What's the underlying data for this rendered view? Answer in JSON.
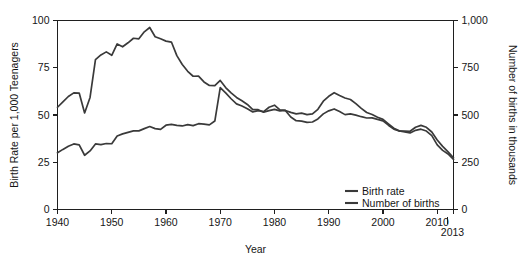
{
  "chart_data": {
    "type": "line",
    "title": "",
    "subtitle": "",
    "xlabel": "Year",
    "ylabel": "Birth Rate per 1,000 Teenagers",
    "y2label": "Number of births in thousands",
    "xlim": [
      1940,
      2013
    ],
    "ylim": [
      0,
      100
    ],
    "y2lim": [
      0,
      1000
    ],
    "xticks": [
      1940,
      1950,
      1960,
      1970,
      1980,
      1990,
      2000,
      2010
    ],
    "xticklabels": [
      "1940",
      "1950",
      "1960",
      "1970",
      "1980",
      "1990",
      "2000",
      "2010"
    ],
    "x_end_tick": 2013,
    "x_end_label": "2013",
    "yticks": [
      0,
      25,
      50,
      75,
      100
    ],
    "yticklabels": [
      "0",
      "25",
      "50",
      "75",
      "100"
    ],
    "y2ticks": [
      0,
      250,
      500,
      750,
      1000
    ],
    "y2ticklabels": [
      "0",
      "250",
      "500",
      "750",
      "1,000"
    ],
    "grid": false,
    "legend_position": "bottom-right",
    "line_color": "#3a3a3a",
    "axis_color": "#1f1f1f",
    "x": [
      1940,
      1941,
      1942,
      1943,
      1944,
      1945,
      1946,
      1947,
      1948,
      1949,
      1950,
      1951,
      1952,
      1953,
      1954,
      1955,
      1956,
      1957,
      1958,
      1959,
      1960,
      1961,
      1962,
      1963,
      1964,
      1965,
      1966,
      1967,
      1968,
      1969,
      1970,
      1971,
      1972,
      1973,
      1974,
      1975,
      1976,
      1977,
      1978,
      1979,
      1980,
      1981,
      1982,
      1983,
      1984,
      1985,
      1986,
      1987,
      1988,
      1989,
      1990,
      1991,
      1992,
      1993,
      1994,
      1995,
      1996,
      1997,
      1998,
      1999,
      2000,
      2001,
      2002,
      2003,
      2004,
      2005,
      2006,
      2007,
      2008,
      2009,
      2010,
      2011,
      2012,
      2013
    ],
    "series": [
      {
        "name": "Birth rate",
        "axis": "left",
        "unit": "births per 1,000 teenagers aged 15-19",
        "values": [
          54.1,
          56.9,
          59.8,
          61.7,
          61.6,
          51.1,
          59.3,
          79.3,
          81.8,
          83.4,
          81.6,
          87.6,
          86.1,
          88.2,
          90.6,
          90.3,
          94.0,
          96.3,
          91.4,
          90.3,
          89.1,
          88.6,
          81.4,
          76.7,
          73.1,
          70.5,
          70.6,
          67.5,
          65.6,
          65.5,
          68.3,
          64.5,
          61.7,
          59.3,
          57.5,
          55.6,
          52.8,
          52.8,
          51.5,
          52.3,
          53.0,
          52.2,
          52.4,
          51.4,
          50.6,
          51.0,
          50.2,
          50.6,
          53.0,
          57.3,
          59.9,
          61.8,
          60.3,
          59.0,
          58.2,
          56.0,
          53.5,
          51.3,
          50.3,
          48.8,
          47.7,
          45.3,
          43.0,
          41.6,
          41.1,
          40.5,
          41.9,
          42.5,
          41.5,
          39.1,
          34.2,
          31.3,
          29.4,
          26.5
        ]
      },
      {
        "name": "Number of births",
        "axis": "right",
        "unit": "thousands of births to teenagers",
        "values": [
          300,
          318,
          335,
          347,
          342,
          287,
          310,
          347,
          343,
          349,
          348,
          389,
          400,
          408,
          416,
          416,
          428,
          439,
          428,
          424,
          446,
          450,
          445,
          442,
          449,
          444,
          454,
          452,
          448,
          468,
          645,
          617,
          586,
          559,
          548,
          533,
          516,
          523,
          518,
          541,
          552,
          527,
          524,
          489,
          470,
          468,
          461,
          463,
          479,
          506,
          522,
          532,
          518,
          502,
          506,
          499,
          491,
          484,
          485,
          477,
          469,
          446,
          425,
          415,
          415,
          414,
          435,
          445,
          435,
          410,
          368,
          334,
          305,
          274
        ]
      }
    ]
  },
  "legend": {
    "items": [
      {
        "label": "Birth rate",
        "color": "#3a3a3a"
      },
      {
        "label": "Number of births",
        "color": "#3a3a3a"
      }
    ]
  }
}
